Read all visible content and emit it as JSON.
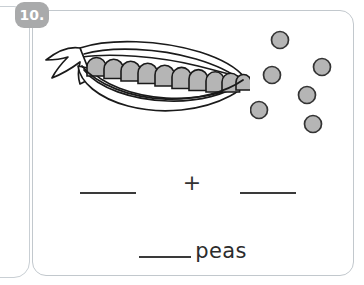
{
  "worksheet": {
    "problem_number": "10.",
    "equation": {
      "first_blank_value": "",
      "operator": "+",
      "second_blank_value": ""
    },
    "answer": {
      "blank_value": "",
      "unit_label": "peas"
    }
  },
  "illustration": {
    "pod": {
      "name": "open-pea-pod",
      "peas_inside": 10,
      "pea_fill": "#b5b5b5",
      "outline_color": "#1a1a1a"
    },
    "loose_peas": {
      "count": 6,
      "fill": "#b5b5b5",
      "outline_color": "#333333",
      "positions": [
        {
          "cx": 30,
          "cy": 18,
          "r": 8.5
        },
        {
          "cx": 72,
          "cy": 45,
          "r": 8.5
        },
        {
          "cx": 22,
          "cy": 53,
          "r": 8.5
        },
        {
          "cx": 57,
          "cy": 73,
          "r": 8.5
        },
        {
          "cx": 8,
          "cy": 88,
          "r": 8.5
        },
        {
          "cx": 63,
          "cy": 102,
          "r": 8.5
        }
      ]
    }
  },
  "colors": {
    "badge_background": "#a9aaab",
    "badge_text": "#ffffff",
    "card_border": "#c2c8cd",
    "frame_border": "#c9cfd4",
    "line_color": "#3a3a3a",
    "text_color": "#2c2c2c",
    "page_background": "#ffffff"
  }
}
